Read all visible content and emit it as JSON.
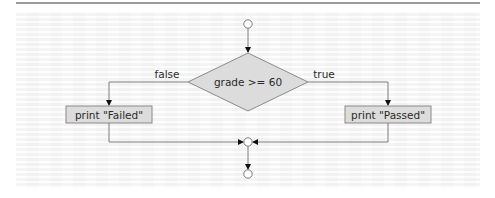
{
  "diagram": {
    "type": "flowchart",
    "decision": {
      "label": "grade >= 60"
    },
    "branches": {
      "false": {
        "label": "false",
        "action": "print \"Failed\""
      },
      "true": {
        "label": "true",
        "action": "print \"Passed\""
      }
    },
    "nodes": [
      {
        "id": "start",
        "kind": "initial-state"
      },
      {
        "id": "decision",
        "kind": "decision",
        "label": "grade >= 60"
      },
      {
        "id": "failed",
        "kind": "action",
        "label": "print \"Failed\""
      },
      {
        "id": "passed",
        "kind": "action",
        "label": "print \"Passed\""
      },
      {
        "id": "merge",
        "kind": "merge"
      },
      {
        "id": "end",
        "kind": "final-state"
      }
    ],
    "edges": [
      {
        "from": "start",
        "to": "decision"
      },
      {
        "from": "decision",
        "to": "failed",
        "guard": "false"
      },
      {
        "from": "decision",
        "to": "passed",
        "guard": "true"
      },
      {
        "from": "failed",
        "to": "merge"
      },
      {
        "from": "passed",
        "to": "merge"
      },
      {
        "from": "merge",
        "to": "end"
      }
    ],
    "colors": {
      "shape_fill": "#dcdcdc",
      "shape_stroke": "#8a8a8a",
      "line": "#7a7a7a",
      "arrowhead": "#111111",
      "text": "#2a2a2a",
      "rule": "#9a9a9a"
    }
  }
}
